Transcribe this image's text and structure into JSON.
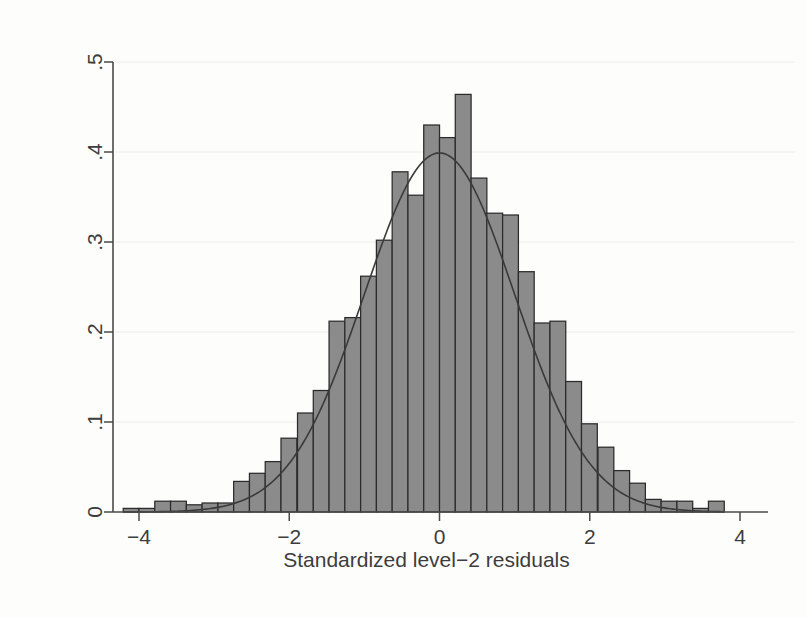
{
  "chart_data": {
    "type": "bar",
    "title": "",
    "subtitle": "",
    "xlabel": "Standardized level−2 residuals",
    "ylabel": "Density",
    "xlim": [
      -4.35,
      4.0
    ],
    "ylim": [
      0,
      0.5
    ],
    "xticks": [
      -4,
      -2,
      0,
      2,
      4
    ],
    "xtick_labels": [
      "−4",
      "−2",
      "0",
      "2",
      "4"
    ],
    "yticks": [
      0,
      0.1,
      0.2,
      0.3,
      0.4,
      0.5
    ],
    "ytick_labels": [
      "0",
      ".1",
      ".2",
      ".3",
      ".4",
      ".5"
    ],
    "grid": "horizontal",
    "legend": "none",
    "bin_width": 0.2105,
    "bin_left_edges": [
      -4.21,
      -4.0,
      -3.79,
      -3.58,
      -3.37,
      -3.16,
      -2.95,
      -2.74,
      -2.53,
      -2.32,
      -2.11,
      -1.89,
      -1.68,
      -1.47,
      -1.26,
      -1.05,
      -0.84,
      -0.63,
      -0.42,
      -0.21,
      0.0,
      0.21,
      0.42,
      0.63,
      0.84,
      1.05,
      1.26,
      1.47,
      1.68,
      1.89,
      2.11,
      2.32,
      2.53,
      2.74,
      2.95,
      3.16,
      3.37,
      3.58
    ],
    "categories": [
      "-4.11",
      "-3.90",
      "-3.68",
      "-3.47",
      "-3.26",
      "-3.05",
      "-2.84",
      "-2.63",
      "-2.42",
      "-2.21",
      "-2.00",
      "-1.79",
      "-1.58",
      "-1.37",
      "-1.16",
      "-0.95",
      "-0.74",
      "-0.53",
      "-0.32",
      "-0.11",
      "0.11",
      "0.32",
      "0.53",
      "0.74",
      "0.95",
      "1.16",
      "1.37",
      "1.58",
      "1.79",
      "2.00",
      "2.21",
      "2.42",
      "2.63",
      "2.84",
      "3.05",
      "3.26",
      "3.47",
      "3.68"
    ],
    "values": [
      0.004,
      0.004,
      0.012,
      0.012,
      0.008,
      0.01,
      0.01,
      0.034,
      0.043,
      0.056,
      0.082,
      0.11,
      0.135,
      0.212,
      0.216,
      0.262,
      0.302,
      0.378,
      0.352,
      0.43,
      0.416,
      0.464,
      0.371,
      0.332,
      0.33,
      0.267,
      0.21,
      0.212,
      0.145,
      0.098,
      0.072,
      0.046,
      0.032,
      0.014,
      0.012,
      0.012,
      0.004,
      0.012
    ],
    "overlay": {
      "name": "normal density",
      "type": "line",
      "mean": 0,
      "sd": 1,
      "peak_value": 0.3989
    }
  },
  "axes": {
    "x_title": "Standardized level−2 residuals",
    "y_title": "Density"
  }
}
